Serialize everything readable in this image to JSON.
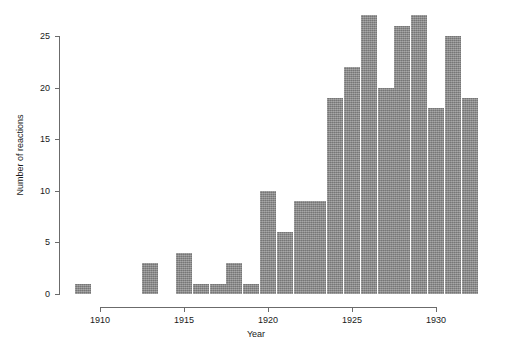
{
  "chart_data": {
    "type": "bar",
    "title": "",
    "subtitle": "",
    "xlabel": "Year",
    "ylabel": "Number of reactions",
    "xlim": [
      1908.5,
      1932.5
    ],
    "ylim": [
      0,
      27
    ],
    "xticks": [
      1910,
      1915,
      1920,
      1925,
      1930
    ],
    "yticks": [
      0,
      5,
      10,
      15,
      20,
      25
    ],
    "grid": false,
    "legend": null,
    "bar_color": "#8d8d8d",
    "categories": [
      1909,
      1910,
      1911,
      1912,
      1913,
      1914,
      1915,
      1916,
      1917,
      1918,
      1919,
      1920,
      1921,
      1922,
      1923,
      1924,
      1925,
      1926,
      1927,
      1928,
      1929,
      1930,
      1931,
      1932
    ],
    "values": [
      1,
      0,
      0,
      0,
      3,
      0,
      4,
      1,
      1,
      3,
      1,
      10,
      6,
      9,
      9,
      19,
      22,
      27,
      20,
      26,
      27,
      18,
      25,
      19
    ]
  },
  "axis": {
    "y_title": "Number of reactions",
    "x_title": "Year",
    "y_tick_labels": [
      "0",
      "5",
      "10",
      "15",
      "20",
      "25"
    ],
    "x_tick_labels": [
      "1910",
      "1915",
      "1920",
      "1925",
      "1930"
    ]
  }
}
